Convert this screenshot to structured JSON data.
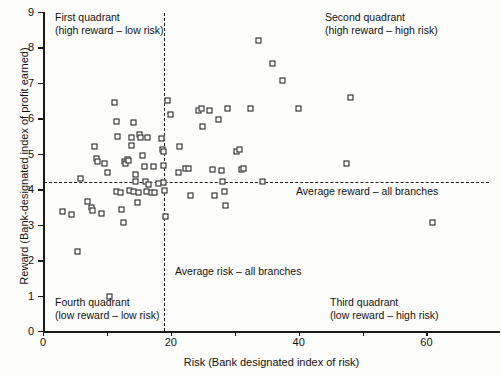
{
  "chart_data": {
    "type": "scatter",
    "title": "",
    "xlabel": "Risk (Bank designated index of risk)",
    "ylabel": "Reward (Bank-designated index of profit earned)",
    "xlim": [
      0,
      71.5
    ],
    "ylim": [
      0,
      9
    ],
    "grid": false,
    "legend": "none",
    "marker": "open-square",
    "x_ticks": [
      0,
      10,
      20,
      30,
      40,
      50,
      60
    ],
    "x_tick_labels": [
      "0",
      "",
      "20",
      "",
      "40",
      "",
      "60"
    ],
    "y_ticks": [
      0,
      1,
      2,
      3,
      4,
      5,
      6,
      7,
      8,
      9
    ],
    "y_tick_labels": [
      "0",
      "1",
      "2",
      "3",
      "4",
      "5",
      "6",
      "7",
      "8",
      "9"
    ],
    "reference_lines": [
      {
        "name": "average-reward",
        "orientation": "horizontal",
        "value": 4.2,
        "style": "dashed",
        "label": "Average reward – all branches"
      },
      {
        "name": "average-risk",
        "orientation": "vertical",
        "value": 19.0,
        "style": "dashed",
        "label": "Average risk – all branches"
      }
    ],
    "quadrant_labels": [
      {
        "name": "first-quadrant",
        "line1": "First quadrant",
        "line2": "(high reward – low risk)"
      },
      {
        "name": "second-quadrant",
        "line1": "Second quadrant",
        "line2": "(high reward – high risk)"
      },
      {
        "name": "third-quadrant",
        "line1": "Third quadrant",
        "line2": "(low reward – high risk)"
      },
      {
        "name": "fourth-quadrant",
        "line1": "Fourth quadrant",
        "line2": "(low reward – low risk)"
      }
    ],
    "points": [
      [
        3.1,
        3.37
      ],
      [
        4.6,
        3.27
      ],
      [
        5.4,
        2.23
      ],
      [
        6.0,
        4.29
      ],
      [
        7.0,
        3.65
      ],
      [
        7.7,
        3.47
      ],
      [
        7.9,
        3.39
      ],
      [
        8.1,
        5.18
      ],
      [
        8.5,
        4.86
      ],
      [
        8.6,
        4.78
      ],
      [
        9.2,
        3.29
      ],
      [
        9.7,
        4.72
      ],
      [
        10.2,
        4.45
      ],
      [
        10.5,
        0.95
      ],
      [
        11.2,
        6.44
      ],
      [
        11.5,
        5.9
      ],
      [
        11.6,
        3.92
      ],
      [
        11.7,
        5.46
      ],
      [
        12.2,
        3.88
      ],
      [
        12.3,
        3.41
      ],
      [
        12.6,
        3.04
      ],
      [
        12.8,
        4.78
      ],
      [
        13.0,
        4.72
      ],
      [
        13.3,
        4.82
      ],
      [
        13.4,
        4.8
      ],
      [
        13.6,
        3.95
      ],
      [
        13.9,
        5.23
      ],
      [
        14.0,
        5.45
      ],
      [
        14.2,
        3.92
      ],
      [
        14.3,
        5.87
      ],
      [
        14.5,
        4.4
      ],
      [
        14.6,
        4.2
      ],
      [
        14.8,
        3.6
      ],
      [
        15.0,
        3.9
      ],
      [
        15.2,
        5.52
      ],
      [
        15.4,
        5.45
      ],
      [
        15.6,
        4.95
      ],
      [
        15.9,
        4.62
      ],
      [
        16.1,
        4.2
      ],
      [
        16.2,
        3.92
      ],
      [
        16.4,
        5.45
      ],
      [
        16.6,
        4.12
      ],
      [
        17.0,
        3.9
      ],
      [
        17.4,
        4.62
      ],
      [
        17.6,
        3.9
      ],
      [
        18.2,
        4.15
      ],
      [
        18.6,
        5.43
      ],
      [
        18.8,
        5.12
      ],
      [
        19.0,
        5.06
      ],
      [
        19.0,
        4.66
      ],
      [
        19.0,
        4.18
      ],
      [
        19.1,
        3.95
      ],
      [
        19.2,
        3.22
      ],
      [
        19.6,
        6.5
      ],
      [
        20.0,
        6.08
      ],
      [
        21.2,
        4.45
      ],
      [
        21.4,
        5.18
      ],
      [
        22.4,
        4.58
      ],
      [
        22.8,
        4.56
      ],
      [
        23.2,
        3.82
      ],
      [
        24.4,
        6.22
      ],
      [
        24.8,
        6.27
      ],
      [
        25.0,
        5.76
      ],
      [
        26.2,
        6.22
      ],
      [
        26.6,
        4.54
      ],
      [
        26.9,
        3.8
      ],
      [
        27.6,
        5.95
      ],
      [
        28.0,
        4.52
      ],
      [
        28.2,
        4.2
      ],
      [
        28.4,
        3.92
      ],
      [
        28.6,
        3.54
      ],
      [
        29.0,
        6.27
      ],
      [
        30.4,
        5.05
      ],
      [
        30.8,
        5.12
      ],
      [
        31.2,
        4.55
      ],
      [
        31.4,
        4.56
      ],
      [
        32.6,
        6.26
      ],
      [
        33.8,
        8.17
      ],
      [
        34.4,
        4.2
      ],
      [
        36.0,
        7.52
      ],
      [
        37.6,
        7.05
      ],
      [
        40.0,
        6.27
      ],
      [
        47.6,
        4.72
      ],
      [
        48.2,
        6.58
      ],
      [
        61.0,
        3.05
      ]
    ]
  }
}
